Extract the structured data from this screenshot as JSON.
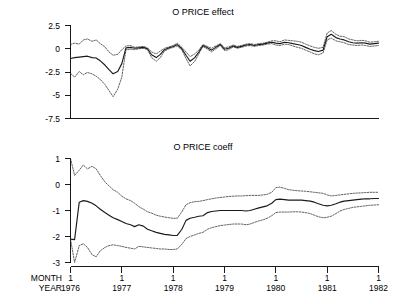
{
  "figure": {
    "width": 406,
    "height": 304,
    "background": "#ffffff",
    "ink_color": "#000000"
  },
  "axis_row_labels": {
    "month": "MONTH",
    "year": "YEAR"
  },
  "chart_data": [
    {
      "type": "line",
      "title": "O PRICE effect",
      "xlabel": "",
      "ylabel": "",
      "grid": false,
      "legend": "none",
      "xlim": [
        1976.0,
        1982.0
      ],
      "ylim": [
        -7.5,
        2.5
      ],
      "yticks": [
        2.5,
        0,
        -2.5,
        -5,
        -7.5
      ],
      "ytick_labels": [
        "2.5",
        "0",
        "-2.5",
        "-5",
        "-7.5"
      ],
      "xticks": [
        1976,
        1977,
        1978,
        1979,
        1980,
        1981,
        1982
      ],
      "xtick_labels_month": [
        "1",
        "1",
        "1",
        "1",
        "1",
        "1",
        "1"
      ],
      "xtick_labels_year": [
        "1976",
        "1977",
        "1978",
        "1979",
        "1980",
        "1981",
        "1982"
      ],
      "x": [
        1976.0,
        1976.08,
        1976.17,
        1976.25,
        1976.33,
        1976.42,
        1976.5,
        1976.58,
        1976.67,
        1976.75,
        1976.83,
        1976.92,
        1977.0,
        1977.08,
        1977.17,
        1977.25,
        1977.33,
        1977.42,
        1977.5,
        1977.58,
        1977.67,
        1977.75,
        1977.83,
        1977.92,
        1978.0,
        1978.08,
        1978.17,
        1978.25,
        1978.33,
        1978.42,
        1978.5,
        1978.58,
        1978.67,
        1978.75,
        1978.83,
        1978.92,
        1979.0,
        1979.08,
        1979.17,
        1979.25,
        1979.33,
        1979.42,
        1979.5,
        1979.58,
        1979.67,
        1979.75,
        1979.83,
        1979.92,
        1980.0,
        1980.08,
        1980.17,
        1980.25,
        1980.33,
        1980.42,
        1980.5,
        1980.58,
        1980.67,
        1980.75,
        1980.83,
        1980.92,
        1981.0,
        1981.08,
        1981.17,
        1981.25,
        1981.33,
        1981.42,
        1981.5,
        1981.58,
        1981.67,
        1981.75,
        1981.83,
        1981.92,
        1982.0
      ],
      "series": [
        {
          "name": "effect upper band",
          "style": "dotted",
          "values": [
            0.45,
            0.6,
            0.5,
            0.95,
            1.05,
            0.8,
            0.95,
            0.55,
            0.2,
            -0.35,
            -0.7,
            -0.6,
            -0.1,
            0.3,
            0.35,
            0.15,
            0.2,
            0.25,
            0.1,
            -0.35,
            -0.55,
            -0.25,
            0.05,
            0.2,
            0.35,
            0.6,
            0.15,
            -0.35,
            -0.85,
            -0.55,
            -0.15,
            0.45,
            0.25,
            0.05,
            0.3,
            0.55,
            0.1,
            0.2,
            0.4,
            0.25,
            0.35,
            0.5,
            0.55,
            0.45,
            0.55,
            0.6,
            0.7,
            0.85,
            0.85,
            0.75,
            0.95,
            0.9,
            0.85,
            0.8,
            0.7,
            0.5,
            0.3,
            0.15,
            0.05,
            0.15,
            1.7,
            1.95,
            1.55,
            1.35,
            1.3,
            1.05,
            0.95,
            0.85,
            0.9,
            0.85,
            0.7,
            0.75,
            0.8
          ]
        },
        {
          "name": "effect center",
          "style": "solid",
          "values": [
            -1.05,
            -0.95,
            -0.9,
            -0.85,
            -0.8,
            -0.95,
            -1.0,
            -1.3,
            -1.75,
            -2.25,
            -2.7,
            -2.45,
            -1.6,
            0.1,
            0.15,
            0.05,
            0.1,
            0.15,
            0.0,
            -0.65,
            -0.95,
            -0.6,
            -0.1,
            0.1,
            0.25,
            0.45,
            0.0,
            -0.7,
            -1.35,
            -0.95,
            -0.35,
            0.35,
            0.1,
            -0.15,
            0.15,
            0.45,
            -0.05,
            0.05,
            0.3,
            0.15,
            0.25,
            0.4,
            0.45,
            0.35,
            0.45,
            0.5,
            0.6,
            0.7,
            0.6,
            0.55,
            0.7,
            0.65,
            0.55,
            0.45,
            0.35,
            0.15,
            -0.05,
            -0.2,
            -0.3,
            -0.15,
            1.3,
            1.55,
            1.2,
            1.05,
            0.95,
            0.75,
            0.65,
            0.6,
            0.65,
            0.6,
            0.5,
            0.55,
            0.6
          ]
        },
        {
          "name": "effect lower band",
          "style": "dotted",
          "values": [
            -2.65,
            -3.05,
            -2.45,
            -2.8,
            -2.55,
            -2.7,
            -2.95,
            -3.3,
            -3.85,
            -4.5,
            -5.15,
            -4.35,
            -3.05,
            -0.1,
            -0.05,
            -0.1,
            0.0,
            0.05,
            -0.1,
            -0.95,
            -1.35,
            -0.95,
            -0.25,
            0.0,
            0.15,
            0.3,
            -0.15,
            -1.05,
            -1.85,
            -1.35,
            -0.55,
            0.25,
            -0.05,
            -0.35,
            0.0,
            0.35,
            -0.2,
            -0.1,
            0.2,
            0.05,
            0.15,
            0.3,
            0.35,
            0.25,
            0.35,
            0.4,
            0.5,
            0.55,
            0.4,
            0.35,
            0.5,
            0.45,
            0.3,
            0.15,
            0.05,
            -0.15,
            -0.35,
            -0.55,
            -0.65,
            -0.45,
            0.95,
            1.15,
            0.85,
            0.75,
            0.65,
            0.45,
            0.4,
            0.35,
            0.4,
            0.35,
            0.25,
            0.3,
            0.35
          ]
        }
      ]
    },
    {
      "type": "line",
      "title": "O PRICE coeff",
      "xlabel": "",
      "ylabel": "",
      "grid": false,
      "legend": "none",
      "xlim": [
        1976.0,
        1982.0
      ],
      "ylim": [
        -3.0,
        1.0
      ],
      "yticks": [
        1,
        0,
        -1,
        -2,
        -3
      ],
      "ytick_labels": [
        "1",
        "0",
        "-1",
        "-2",
        "-3"
      ],
      "xticks": [
        1976,
        1977,
        1978,
        1979,
        1980,
        1981,
        1982
      ],
      "xtick_labels_month": [
        "1",
        "1",
        "1",
        "1",
        "1",
        "1",
        "1"
      ],
      "xtick_labels_year": [
        "1976",
        "1977",
        "1978",
        "1979",
        "1980",
        "1981",
        "1982"
      ],
      "x": [
        1976.0,
        1976.08,
        1976.17,
        1976.25,
        1976.33,
        1976.42,
        1976.5,
        1976.58,
        1976.67,
        1976.75,
        1976.83,
        1976.92,
        1977.0,
        1977.08,
        1977.17,
        1977.25,
        1977.33,
        1977.42,
        1977.5,
        1977.58,
        1977.67,
        1977.75,
        1977.83,
        1977.92,
        1978.0,
        1978.08,
        1978.17,
        1978.25,
        1978.33,
        1978.42,
        1978.5,
        1978.58,
        1978.67,
        1978.75,
        1978.83,
        1978.92,
        1979.0,
        1979.08,
        1979.17,
        1979.25,
        1979.33,
        1979.42,
        1979.5,
        1979.58,
        1979.67,
        1979.75,
        1979.83,
        1979.92,
        1980.0,
        1980.08,
        1980.17,
        1980.25,
        1980.33,
        1980.42,
        1980.5,
        1980.58,
        1980.67,
        1980.75,
        1980.83,
        1980.92,
        1981.0,
        1981.08,
        1981.17,
        1981.25,
        1981.33,
        1981.42,
        1981.5,
        1981.58,
        1981.67,
        1981.75,
        1981.83,
        1981.92,
        1982.0
      ],
      "series": [
        {
          "name": "coeff upper band",
          "style": "dotted",
          "values": [
            1.0,
            0.35,
            0.55,
            0.75,
            0.6,
            0.7,
            0.6,
            0.35,
            0.1,
            -0.05,
            -0.2,
            -0.3,
            -0.45,
            -0.55,
            -0.62,
            -0.72,
            -0.85,
            -0.95,
            -1.05,
            -1.1,
            -1.18,
            -1.22,
            -1.25,
            -1.28,
            -1.3,
            -1.3,
            -1.05,
            -0.78,
            -0.7,
            -0.66,
            -0.65,
            -0.62,
            -0.58,
            -0.55,
            -0.52,
            -0.5,
            -0.48,
            -0.46,
            -0.45,
            -0.44,
            -0.44,
            -0.43,
            -0.42,
            -0.42,
            -0.42,
            -0.4,
            -0.38,
            -0.3,
            -0.12,
            -0.1,
            -0.15,
            -0.2,
            -0.22,
            -0.24,
            -0.25,
            -0.26,
            -0.28,
            -0.3,
            -0.32,
            -0.34,
            -0.4,
            -0.44,
            -0.42,
            -0.4,
            -0.38,
            -0.36,
            -0.34,
            -0.33,
            -0.32,
            -0.31,
            -0.3,
            -0.3,
            -0.3
          ]
        },
        {
          "name": "coeff center",
          "style": "solid",
          "values": [
            -2.1,
            -2.12,
            -0.68,
            -0.62,
            -0.65,
            -0.72,
            -0.82,
            -0.95,
            -1.08,
            -1.18,
            -1.28,
            -1.35,
            -1.42,
            -1.5,
            -1.55,
            -1.62,
            -1.55,
            -1.6,
            -1.72,
            -1.78,
            -1.84,
            -1.88,
            -1.92,
            -1.94,
            -1.96,
            -1.96,
            -1.72,
            -1.38,
            -1.3,
            -1.26,
            -1.22,
            -1.2,
            -1.08,
            -1.04,
            -1.02,
            -1.0,
            -1.0,
            -1.0,
            -1.0,
            -1.0,
            -1.0,
            -1.02,
            -1.0,
            -0.95,
            -0.9,
            -0.86,
            -0.82,
            -0.72,
            -0.58,
            -0.56,
            -0.58,
            -0.6,
            -0.6,
            -0.6,
            -0.6,
            -0.62,
            -0.64,
            -0.68,
            -0.74,
            -0.8,
            -0.82,
            -0.8,
            -0.74,
            -0.68,
            -0.64,
            -0.62,
            -0.6,
            -0.58,
            -0.56,
            -0.55,
            -0.55,
            -0.54,
            -0.54
          ]
        },
        {
          "name": "coeff lower band",
          "style": "dotted",
          "values": [
            -2.1,
            -3.0,
            -2.35,
            -2.28,
            -2.42,
            -2.7,
            -2.78,
            -2.55,
            -2.42,
            -2.35,
            -2.32,
            -2.35,
            -2.38,
            -2.42,
            -2.45,
            -2.48,
            -2.38,
            -2.4,
            -2.42,
            -2.44,
            -2.46,
            -2.48,
            -2.48,
            -2.5,
            -2.5,
            -2.48,
            -2.3,
            -2.08,
            -2.0,
            -1.94,
            -1.88,
            -1.84,
            -1.72,
            -1.66,
            -1.62,
            -1.58,
            -1.56,
            -1.54,
            -1.52,
            -1.52,
            -1.52,
            -1.55,
            -1.52,
            -1.46,
            -1.4,
            -1.36,
            -1.3,
            -1.2,
            -1.08,
            -1.06,
            -1.06,
            -1.06,
            -1.05,
            -1.05,
            -1.06,
            -1.08,
            -1.12,
            -1.18,
            -1.24,
            -1.28,
            -1.26,
            -1.22,
            -1.12,
            -1.02,
            -0.96,
            -0.92,
            -0.88,
            -0.86,
            -0.84,
            -0.82,
            -0.8,
            -0.79,
            -0.78
          ]
        }
      ]
    }
  ]
}
